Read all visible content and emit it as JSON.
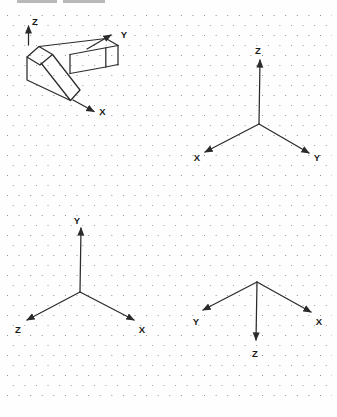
{
  "figure": {
    "description_label": "isometric-axes-figure",
    "colors": {
      "line": "#2b2b2b",
      "label": "#1a1a1a",
      "dot": "#8d8d8d",
      "top_marks": "#b8b8b8"
    },
    "object_view": {
      "x_label": "X",
      "y_label": "Y",
      "z_label": "Z"
    },
    "axes_upper_right": {
      "up_label": "Z",
      "lower_left_label": "X",
      "lower_right_label": "Y"
    },
    "axes_lower_left": {
      "up_label": "Y",
      "lower_left_label": "Z",
      "lower_right_label": "X"
    },
    "axes_lower_right": {
      "left_label": "Y",
      "right_label": "X",
      "down_label": "Z"
    }
  }
}
